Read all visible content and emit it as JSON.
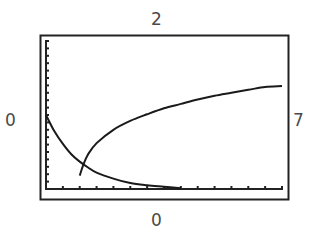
{
  "window": {
    "ymax_label": "2",
    "ymin_label": "0",
    "xmin_label": "0",
    "xmax_label": "7"
  },
  "chart_data": {
    "type": "line",
    "title": "",
    "xlabel": "",
    "ylabel": "",
    "xlim": [
      0,
      7
    ],
    "ylim": [
      0,
      2
    ],
    "grid": false,
    "legend": null,
    "x_tick_step": 0.5,
    "y_tick_step": 0.1,
    "series": [
      {
        "name": "decaying curve",
        "x": [
          0,
          0.25,
          0.5,
          0.75,
          1.0,
          1.25,
          1.5,
          2.0,
          2.5,
          3.0,
          3.5,
          4.0
        ],
        "y": [
          1.0,
          0.78,
          0.61,
          0.47,
          0.37,
          0.29,
          0.22,
          0.14,
          0.08,
          0.05,
          0.03,
          0.01
        ]
      },
      {
        "name": "rising curve",
        "x": [
          1.0,
          1.1,
          1.25,
          1.5,
          2.0,
          2.5,
          3.0,
          3.5,
          4.0,
          4.5,
          5.0,
          5.5,
          6.0,
          6.5,
          7.0
        ],
        "y": [
          0.18,
          0.32,
          0.47,
          0.62,
          0.8,
          0.92,
          1.01,
          1.09,
          1.15,
          1.21,
          1.26,
          1.3,
          1.34,
          1.38,
          1.39
        ]
      }
    ]
  }
}
